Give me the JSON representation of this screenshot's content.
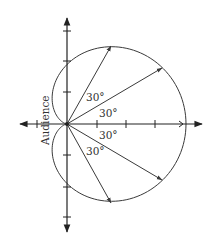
{
  "diagram": {
    "type": "polar-cardioid-pickup-pattern",
    "axis_label": "Audience",
    "angle_labels": [
      {
        "id": "upper-60",
        "text": "30°"
      },
      {
        "id": "upper-30",
        "text": "30°"
      },
      {
        "id": "lower-30",
        "text": "30°"
      },
      {
        "id": "lower-60",
        "text": "30°"
      }
    ],
    "rays_degrees": [
      60,
      30,
      -30,
      -60
    ],
    "horizontal_ticks": 4,
    "vertical_ticks_each_side": 3,
    "colors": {
      "line": "#3a3a3a",
      "axis": "#222222",
      "text": "#333333"
    }
  }
}
